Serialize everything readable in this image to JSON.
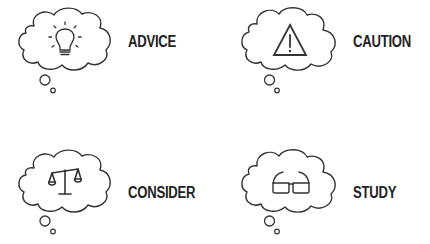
{
  "items": [
    {
      "id": "advice",
      "label": "ADVICE",
      "icon": "lightbulb-icon"
    },
    {
      "id": "caution",
      "label": "CAUTION",
      "icon": "warning-triangle-icon"
    },
    {
      "id": "consider",
      "label": "CONSIDER",
      "icon": "balance-scale-icon"
    },
    {
      "id": "study",
      "label": "STUDY",
      "icon": "reading-glasses-icon"
    }
  ],
  "colors": {
    "stroke": "#333333",
    "text": "#232323",
    "background": "#ffffff"
  }
}
